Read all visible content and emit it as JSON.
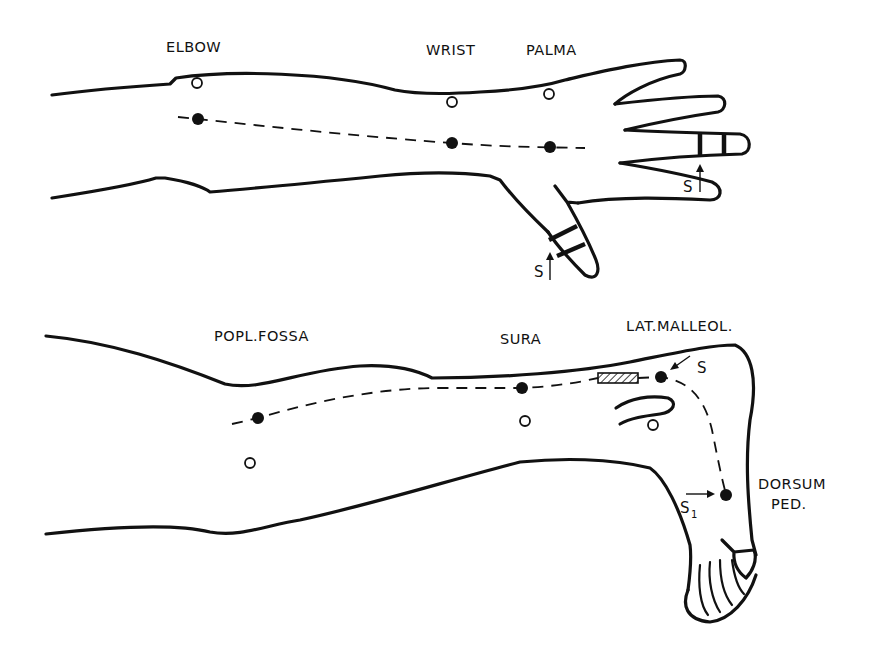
{
  "figure": {
    "arm": {
      "labels": {
        "elbow": "ELBOW",
        "wrist": "WRIST",
        "palma": "PALMA"
      },
      "stimulus_labels": {
        "finger": "S",
        "thumb": "S"
      }
    },
    "leg": {
      "labels": {
        "popl_fossa": "POPL.FOSSA",
        "sura": "SURA",
        "lat_malleol": "LAT.MALLEOL.",
        "dorsum_ped_line1": "DORSUM",
        "dorsum_ped_line2": "PED."
      },
      "stimulus_labels": {
        "malleolus": "S",
        "dorsum": "S",
        "dorsum_subscript": "1"
      }
    },
    "legend": {
      "filled_dot": "stimulation / electrode site on nerve",
      "open_dot": "reference electrode site",
      "dashed_line": "nerve course"
    }
  }
}
